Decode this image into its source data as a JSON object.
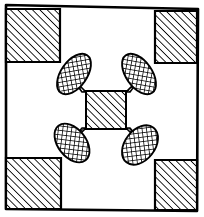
{
  "figure": {
    "title": "Hatched square frame with central hatched square and four crosshatched lobes",
    "type": "line-art-diagram",
    "canvas": {
      "width": 204,
      "height": 217,
      "background": "#ffffff"
    },
    "ink_color": "#000000",
    "stroke_widths": {
      "frame": 2.6,
      "shape": 1.8,
      "hatch": 1.0,
      "crosshatch": 0.9
    },
    "frame": {
      "name": "outer-border",
      "description": "hand-drawn slightly irregular square border",
      "points": "6,5 198,9 197,211 6,209"
    },
    "corner_squares": [
      {
        "name": "corner-square-top-left",
        "points": "6,9 60,9 60,62 6,62",
        "fill": "diagonal-hatch"
      },
      {
        "name": "corner-square-top-right",
        "points": "155,11 197,11 197,63 155,63",
        "fill": "diagonal-hatch"
      },
      {
        "name": "corner-square-bottom-left",
        "points": "6,158 61,158 61,209 6,209",
        "fill": "diagonal-hatch"
      },
      {
        "name": "corner-square-bottom-right",
        "points": "155,160 197,160 197,210 155,210",
        "fill": "diagonal-hatch"
      }
    ],
    "center_square": {
      "name": "center-square",
      "points": "86,91 126,91 126,129 86,129",
      "fill": "diagonal-hatch"
    },
    "lobes": [
      {
        "name": "lobe-top-left",
        "cx": 74,
        "cy": 74,
        "rx": 13,
        "ry": 23,
        "rotate": 35,
        "fill": "crosshatch"
      },
      {
        "name": "lobe-top-right",
        "cx": 139,
        "cy": 74,
        "rx": 13,
        "ry": 23,
        "rotate": -35,
        "fill": "crosshatch"
      },
      {
        "name": "lobe-bottom-left",
        "cx": 72,
        "cy": 143,
        "rx": 14,
        "ry": 22,
        "rotate": -38,
        "fill": "crosshatch"
      },
      {
        "name": "lobe-bottom-right",
        "cx": 140,
        "cy": 145,
        "rx": 15,
        "ry": 22,
        "rotate": 38,
        "fill": "crosshatch"
      }
    ],
    "lobe_necks": [
      {
        "name": "neck-top-left",
        "points": "86,91 78,84 70,75 80,90"
      },
      {
        "name": "neck-top-right",
        "points": "126,91 134,84 142,75 132,90"
      },
      {
        "name": "neck-bottom-left",
        "points": "86,129 78,136 70,145 80,130"
      },
      {
        "name": "neck-bottom-right",
        "points": "126,129 134,136 144,146 132,130"
      }
    ]
  }
}
